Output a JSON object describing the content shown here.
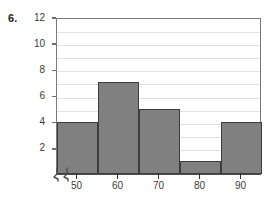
{
  "problem": {
    "number": "6."
  },
  "chart_data": {
    "type": "bar",
    "title": "",
    "subtitle": "",
    "xlabel": "",
    "ylabel": "",
    "categories": [
      "50",
      "60",
      "70",
      "80",
      "90"
    ],
    "values": [
      4,
      7,
      5,
      1,
      4
    ],
    "series": [
      {
        "name": "frequency",
        "values": [
          4,
          7,
          5,
          1,
          4
        ]
      }
    ],
    "ylim": [
      0,
      12
    ],
    "xlim": [
      45,
      95
    ],
    "y_ticks": [
      12,
      10,
      8,
      6,
      4,
      2
    ],
    "y_minor_step": 1,
    "x_ticks": [
      "50",
      "60",
      "70",
      "80",
      "90"
    ],
    "grid": true,
    "grid_axis": "y",
    "legend": false,
    "legend_position": "none",
    "axis_break": "x-axis-break",
    "bin_edges": [
      45,
      55,
      65,
      75,
      85,
      95
    ],
    "colors": {
      "bar_fill": "#808080",
      "bar_edge": "#3d3d3d",
      "gridline": "#e2e2e2",
      "axis": "#4d4d4d",
      "text": "#3b3b3b",
      "background": "#ffffff"
    }
  },
  "icons": {
    "axis_break": "axis-break-icon"
  }
}
